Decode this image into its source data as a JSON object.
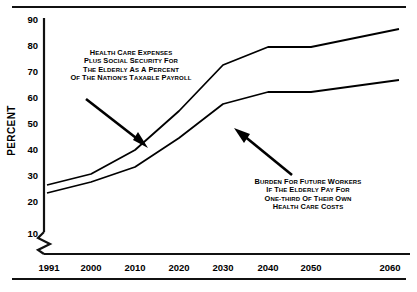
{
  "chart_data": {
    "type": "line",
    "title": "",
    "subtitle": "",
    "xlabel": "",
    "ylabel": "Percent",
    "x": [
      1991,
      2000,
      2010,
      2020,
      2030,
      2040,
      2050,
      2060
    ],
    "xticklabels": [
      "1991",
      "2000",
      "2010",
      "2020",
      "2030",
      "2040",
      "2050",
      "2060"
    ],
    "yticklabels": [
      "10",
      "20",
      "30",
      "40",
      "50",
      "60",
      "70",
      "80",
      "90"
    ],
    "yticks": [
      10,
      20,
      30,
      40,
      50,
      60,
      70,
      80,
      90
    ],
    "ylim": [
      5,
      92
    ],
    "xlim": [
      1988,
      2063
    ],
    "grid": false,
    "legend": null,
    "axis_break": true,
    "series": [
      {
        "name": "Health Care Expenses Plus Social Security for the Elderly as a Percent of the Nation's Taxable Payroll",
        "values": [
          22.5,
          27.0,
          37.0,
          53.0,
          72.0,
          79.5,
          79.5,
          87.0
        ],
        "color": "#000000"
      },
      {
        "name": "Burden for Future Workers if the Elderly Pay for One-Third of Their Own Health Care Costs",
        "values": [
          19.5,
          24.0,
          30.0,
          42.0,
          56.0,
          61.0,
          61.0,
          66.0
        ],
        "color": "#000000"
      }
    ],
    "annotations": [
      {
        "id": "upper",
        "lines": [
          "Health Care Expenses",
          "Plus Social Security for",
          "the Elderly as a Percent",
          "of the Nation's Taxable Payroll"
        ],
        "arrow_to_year": 2012,
        "arrow_to_value": 39
      },
      {
        "id": "lower",
        "lines": [
          "Burden for Future Workers",
          "if the Elderly Pay for",
          "One-Third of Their Own",
          "Health Care Costs"
        ],
        "arrow_to_year": 2031,
        "arrow_to_value": 56
      }
    ]
  },
  "colors": {
    "line": "#000000",
    "axis": "#111111",
    "rule": "#111111",
    "background": "#ffffff"
  }
}
